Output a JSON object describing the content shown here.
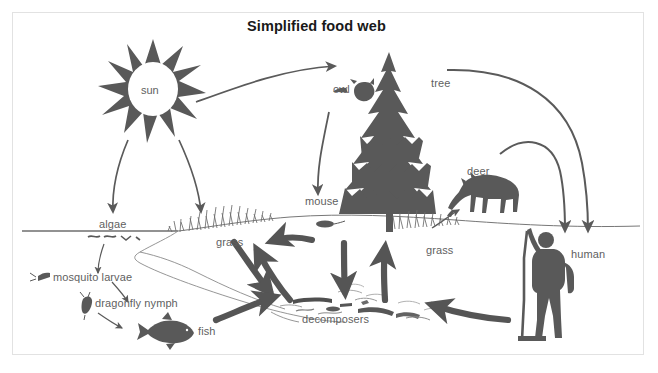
{
  "figure": {
    "title": "Simplified food web",
    "kind": "food-web-diagram",
    "frame_color": "#e2e2e2",
    "silhouette_color": "#595959",
    "arrow_color": "#5a5a5a",
    "thick_arrow_color": "#555555",
    "label_color": "#5f5f5f",
    "background": "#ffffff"
  },
  "labels": {
    "sun": "sun",
    "owl": "owl",
    "tree": "tree",
    "deer": "deer",
    "human": "human",
    "mouse": "mouse",
    "algae": "algae",
    "grass_left": "grass",
    "grass_right": "grass",
    "mosquito_larvae": "mosquito larvae",
    "dragonfly_nymph": "dragonfly nymph",
    "fish": "fish",
    "decomposers": "decomposers"
  },
  "organisms": [
    {
      "name": "sun",
      "label": "sun",
      "icon": "sun-icon",
      "habitat": "sky"
    },
    {
      "name": "tree",
      "label": "tree",
      "icon": "conifer-tree-icon",
      "habitat": "land"
    },
    {
      "name": "owl",
      "label": "owl",
      "icon": "owl-icon",
      "habitat": "land"
    },
    {
      "name": "deer",
      "label": "deer",
      "icon": "deer-icon",
      "habitat": "land"
    },
    {
      "name": "human",
      "label": "human",
      "icon": "hiker-icon",
      "habitat": "land"
    },
    {
      "name": "mouse",
      "label": "mouse",
      "icon": "mouse-icon",
      "habitat": "land"
    },
    {
      "name": "grass-left",
      "label": "grass",
      "icon": "grass-icon",
      "habitat": "shore"
    },
    {
      "name": "grass-right",
      "label": "grass",
      "icon": "grass-icon",
      "habitat": "land"
    },
    {
      "name": "algae",
      "label": "algae",
      "icon": "algae-icon",
      "habitat": "water"
    },
    {
      "name": "mosquito-larvae",
      "label": "mosquito larvae",
      "icon": "mosquito-larva-icon",
      "habitat": "water"
    },
    {
      "name": "dragonfly-nymph",
      "label": "dragonfly nymph",
      "icon": "dragonfly-nymph-icon",
      "habitat": "water"
    },
    {
      "name": "fish",
      "label": "fish",
      "icon": "fish-icon",
      "habitat": "water"
    },
    {
      "name": "decomposers",
      "label": "decomposers",
      "icon": "decomposers-icon",
      "habitat": "pond-bottom"
    }
  ],
  "flows": [
    {
      "from": "sun",
      "to": "tree",
      "style": "thin"
    },
    {
      "from": "sun",
      "to": "algae",
      "style": "thin"
    },
    {
      "from": "sun",
      "to": "grass-left",
      "style": "thin"
    },
    {
      "from": "owl",
      "to": "mouse",
      "style": "thin"
    },
    {
      "from": "tree",
      "to": "human",
      "style": "thin"
    },
    {
      "from": "deer",
      "to": "human",
      "style": "thin"
    },
    {
      "from": "algae",
      "to": "mosquito-larvae",
      "style": "thin"
    },
    {
      "from": "mosquito-larvae",
      "to": "dragonfly-nymph",
      "style": "thin"
    },
    {
      "from": "dragonfly-nymph",
      "to": "fish",
      "style": "thin"
    },
    {
      "from": "grass-right",
      "to": "deer",
      "style": "thin"
    },
    {
      "from": "grass-left",
      "to": "decomposers",
      "style": "thick"
    },
    {
      "from": "decomposers",
      "to": "grass-left",
      "style": "thick"
    },
    {
      "from": "mouse",
      "to": "decomposers",
      "style": "thick"
    },
    {
      "from": "decomposers",
      "to": "grass-right",
      "style": "thick"
    },
    {
      "from": "fish",
      "to": "decomposers",
      "style": "thick"
    },
    {
      "from": "human",
      "to": "decomposers",
      "style": "thick"
    },
    {
      "from": "decomposers",
      "to": "shore",
      "style": "thick"
    }
  ]
}
